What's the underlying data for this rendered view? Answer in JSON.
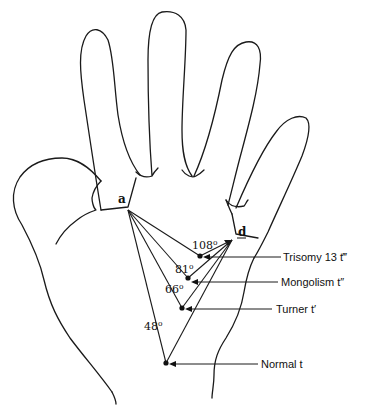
{
  "figure": {
    "triradii": {
      "a": "a",
      "d": "d"
    },
    "points": [
      {
        "id": "trisomy13",
        "label": "Trisomy 13 t‴",
        "angle_deg": 108,
        "angle_text": "108",
        "degree_symbol": "o"
      },
      {
        "id": "mongolism",
        "label": "Mongolism t″",
        "angle_deg": 81,
        "angle_text": "81",
        "degree_symbol": "o"
      },
      {
        "id": "turner",
        "label": "Turner t′",
        "angle_deg": 66,
        "angle_text": "66",
        "degree_symbol": "o"
      },
      {
        "id": "normal",
        "label": "Normal t",
        "angle_deg": 48,
        "angle_text": "48",
        "degree_symbol": "o"
      }
    ],
    "colors": {
      "ink": "#1a1a1a",
      "background": "#ffffff"
    }
  }
}
